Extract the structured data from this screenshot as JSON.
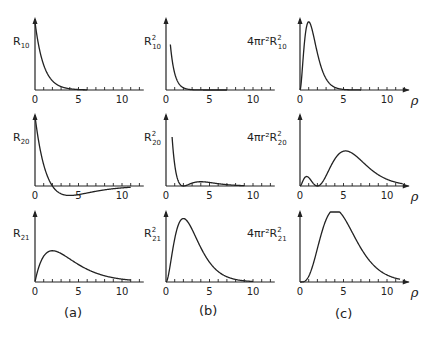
{
  "chart_data": {
    "type": "line",
    "title": "",
    "x_variable": "ρ",
    "xlim": [
      0,
      12
    ],
    "xticks": [
      0,
      5,
      10
    ],
    "minor_tick_step": 1,
    "columns": [
      {
        "panel_label": "(a)",
        "quantity": "R_nl"
      },
      {
        "panel_label": "(b)",
        "quantity": "R_nl^2"
      },
      {
        "panel_label": "(c)",
        "quantity": "4πr^2 R_nl^2"
      }
    ],
    "panels": [
      {
        "row": 0,
        "col": 0,
        "ylabel_main": "R",
        "ylabel_sub": "10",
        "ylabel_sup": "",
        "ylabel_prefix": "",
        "function": "R10",
        "x_end": 6,
        "show_rho": false
      },
      {
        "row": 0,
        "col": 1,
        "ylabel_main": "R",
        "ylabel_sub": "10",
        "ylabel_sup": "2",
        "ylabel_prefix": "",
        "function": "R10sq",
        "x_end": 7,
        "show_rho": false
      },
      {
        "row": 0,
        "col": 2,
        "ylabel_main": "R",
        "ylabel_sub": "10",
        "ylabel_sup": "2",
        "ylabel_prefix": "4πr²",
        "function": "P10",
        "x_end": 7,
        "show_rho": true
      },
      {
        "row": 1,
        "col": 0,
        "ylabel_main": "R",
        "ylabel_sub": "20",
        "ylabel_sup": "",
        "ylabel_prefix": "",
        "function": "R20",
        "x_end": 11,
        "show_rho": false
      },
      {
        "row": 1,
        "col": 1,
        "ylabel_main": "R",
        "ylabel_sub": "20",
        "ylabel_sup": "2",
        "ylabel_prefix": "",
        "function": "R20sq",
        "x_end": 9,
        "show_rho": false
      },
      {
        "row": 1,
        "col": 2,
        "ylabel_main": "R",
        "ylabel_sub": "20",
        "ylabel_sup": "2",
        "ylabel_prefix": "4πr²",
        "function": "P20",
        "x_end": 11.8,
        "show_rho": true
      },
      {
        "row": 2,
        "col": 0,
        "ylabel_main": "R",
        "ylabel_sub": "21",
        "ylabel_sup": "",
        "ylabel_prefix": "",
        "function": "R21",
        "x_end": 11,
        "show_rho": false
      },
      {
        "row": 2,
        "col": 1,
        "ylabel_main": "R",
        "ylabel_sub": "21",
        "ylabel_sup": "2",
        "ylabel_prefix": "",
        "function": "R21sq",
        "x_end": 10,
        "show_rho": false
      },
      {
        "row": 2,
        "col": 2,
        "ylabel_main": "R",
        "ylabel_sub": "21",
        "ylabel_sup": "2",
        "ylabel_prefix": "4πr²",
        "function": "P21",
        "x_end": 11.5,
        "show_rho": true
      }
    ],
    "annotations": {
      "rho_symbol": "ρ",
      "panel_labels": [
        "(a)",
        "(b)",
        "(c)"
      ]
    }
  }
}
